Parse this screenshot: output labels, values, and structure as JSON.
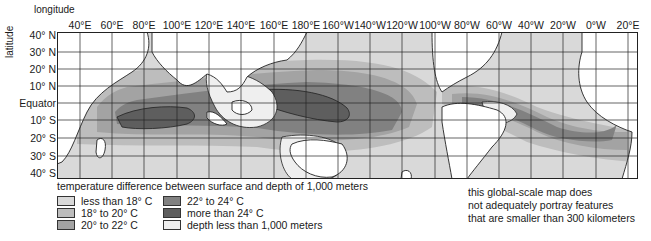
{
  "map": {
    "title_x_axis": "longitude",
    "title_y_axis": "latitude",
    "longitude_labels": [
      "40°E",
      "60°E",
      "80°E",
      "100°E",
      "120°E",
      "140°E",
      "160°E",
      "180°E",
      "160°W",
      "140°W",
      "120°W",
      "100°W",
      "80°W",
      "60°W",
      "40°W",
      "20°W",
      "0°W",
      "20°E"
    ],
    "latitude_labels": [
      "40° N",
      "30° N",
      "20° N",
      "10° N",
      "Equator",
      "10° S",
      "20° S",
      "30° S",
      "40° S"
    ],
    "colors": {
      "lt18": "#d9d9d9",
      "18to20": "#bdbdbd",
      "20to22": "#a3a3a3",
      "22to24": "#818181",
      "gt24": "#5e5e5e",
      "shallow": "#efefef",
      "land": "#ffffff",
      "grid": "#222222"
    }
  },
  "legend": {
    "title": "temperature difference between surface and depth of 1,000 meters",
    "items": [
      {
        "label": "less than 18° C",
        "color": "#d9d9d9"
      },
      {
        "label": "18° to 20° C",
        "color": "#bdbdbd"
      },
      {
        "label": "20° to 22° C",
        "color": "#a3a3a3"
      },
      {
        "label": "22° to 24° C",
        "color": "#818181"
      },
      {
        "label": "more than 24° C",
        "color": "#5e5e5e"
      },
      {
        "label": "depth less than 1,000 meters",
        "color": "#efefef"
      }
    ]
  },
  "note": {
    "line1": "this global-scale map does",
    "line2": "not adequately portray features",
    "line3": "that are smaller than 300 kilometers"
  }
}
